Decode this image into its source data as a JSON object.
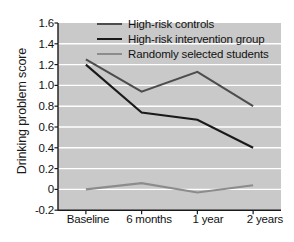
{
  "chart_data": {
    "type": "line",
    "title": "",
    "xlabel": "",
    "ylabel": "Drinking problem score",
    "categories": [
      "Baseline",
      "6 months",
      "1 year",
      "2 years"
    ],
    "ylim": [
      -0.2,
      1.6
    ],
    "yticks": [
      "1.6",
      "1.4",
      "1.2",
      "1.0",
      "0.8",
      "0.6",
      "0.4",
      "0.2",
      "0",
      "-0.2"
    ],
    "ytick_values": [
      1.6,
      1.4,
      1.2,
      1.0,
      0.8,
      0.6,
      0.4,
      0.2,
      0,
      -0.2
    ],
    "grid": true,
    "grid_color": "#ffffff",
    "plot_background": "#c9c9c9",
    "legend_position": "top-center",
    "series": [
      {
        "name": "High-risk controls",
        "color": "#4d4d4d",
        "values": [
          1.25,
          0.94,
          1.13,
          0.8
        ]
      },
      {
        "name": "High-risk intervention group",
        "color": "#1a1a1a",
        "values": [
          1.2,
          0.74,
          0.67,
          0.4
        ]
      },
      {
        "name": "Randomly selected students",
        "color": "#8c8c8c",
        "values": [
          0.0,
          0.06,
          -0.03,
          0.04
        ]
      }
    ]
  },
  "axis": {
    "line_color": "#1a1a1a"
  }
}
